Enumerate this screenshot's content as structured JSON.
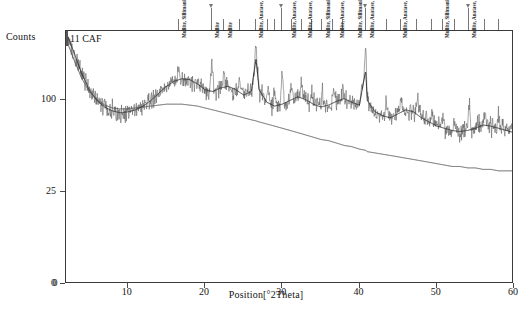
{
  "chart_data": {
    "type": "line",
    "title": "11 CAF",
    "xlabel": "Position[°2Theta]",
    "ylabel": "Counts",
    "xlim": [
      2,
      60
    ],
    "ylim_counts": [
      0,
      190
    ],
    "y_scale": "sqrt",
    "grid": false,
    "legend_position": "none",
    "xticks": [
      10,
      20,
      30,
      40,
      50,
      60
    ],
    "yticks": [
      0,
      25,
      100
    ],
    "series": [
      {
        "name": "measured-pattern",
        "color": "#555555",
        "description": "Noisy XRD intensity trace with broad amorphous humps and sharp crystalline peaks"
      },
      {
        "name": "background-fit",
        "color": "#333333",
        "description": "Smooth fitted background curve decaying from high angle-low counts"
      }
    ],
    "x": [
      2,
      3,
      4,
      5,
      6,
      7,
      8,
      9,
      10,
      11,
      12,
      13,
      14,
      15,
      16,
      17,
      18,
      19,
      20,
      21,
      22,
      23,
      24,
      25,
      26,
      26.6,
      27,
      28,
      29,
      30,
      31,
      32,
      33,
      34,
      35,
      36,
      37,
      38,
      39,
      40,
      40.8,
      41,
      42,
      43,
      44,
      45,
      46,
      47,
      48,
      49,
      50,
      51,
      52,
      53,
      54,
      55,
      56,
      57,
      58,
      59,
      60
    ],
    "y_counts": [
      188,
      160,
      132,
      112,
      100,
      93,
      89,
      87,
      88,
      90,
      94,
      100,
      108,
      116,
      122,
      125,
      124,
      119,
      112,
      110,
      114,
      116,
      112,
      106,
      110,
      150,
      112,
      98,
      94,
      96,
      100,
      104,
      101,
      96,
      93,
      95,
      99,
      102,
      98,
      95,
      135,
      100,
      88,
      84,
      82,
      86,
      90,
      88,
      82,
      78,
      74,
      72,
      70,
      69,
      70,
      72,
      75,
      74,
      72,
      70,
      68
    ],
    "background_counts": [
      178,
      150,
      126,
      110,
      101,
      95,
      92,
      91,
      91,
      92,
      93,
      94,
      95,
      96,
      96,
      96,
      95,
      94,
      92,
      90,
      88,
      86,
      84,
      82,
      80,
      79,
      78,
      76,
      74,
      72,
      70,
      68,
      66,
      64,
      62,
      61,
      59,
      57,
      56,
      54,
      53,
      52,
      51,
      50,
      49,
      48,
      47,
      46,
      45,
      44,
      43,
      42,
      41,
      41,
      40,
      40,
      39,
      39,
      38,
      38,
      38
    ],
    "peak_markers_2theta": [
      16.6,
      20.9,
      22.5,
      24.5,
      26.6,
      28.2,
      29.0,
      30.0,
      31.2,
      32.5,
      33.8,
      35.2,
      36.6,
      37.8,
      40.8,
      43.5,
      45.4,
      47.5,
      49.4,
      50.8,
      52.3,
      54.2,
      56.2,
      58.0
    ],
    "arrow_markers_2theta": [
      20.9,
      30.0,
      40.8,
      54.2
    ],
    "phase_annotations": [
      {
        "x2theta": 16.6,
        "label": "Mullite, Sillimanite"
      },
      {
        "x2theta": 20.9,
        "label": "Mullite"
      },
      {
        "x2theta": 22.5,
        "label": "Mullite"
      },
      {
        "x2theta": 26.6,
        "label": "Mullite, Anatase, syn, Sillimanite"
      },
      {
        "x2theta": 30.9,
        "label": "Mullite, Anatase, syn, Sillimanite"
      },
      {
        "x2theta": 32.9,
        "label": "Mullite, Anatase, syn, Sillimanite"
      },
      {
        "x2theta": 35.3,
        "label": "Mullite, Sillimanite"
      },
      {
        "x2theta": 37.1,
        "label": "Mullite, Anatase, syn, Sillimanite"
      },
      {
        "x2theta": 39.4,
        "label": "Mullite, Sillimanite"
      },
      {
        "x2theta": 40.9,
        "label": "Mullite, Anatase, syn, Sillimanite"
      },
      {
        "x2theta": 45.2,
        "label": "Mullite, Anatase, syn, Sillimanite"
      },
      {
        "x2theta": 50.6,
        "label": "Mullite, Sillimanite"
      },
      {
        "x2theta": 54.2,
        "label": "Mullite, Anatase, syn, Sillimanite"
      }
    ]
  },
  "axes": {
    "y_title": "Counts",
    "x_title": "Position[°2Theta]",
    "y_tick_labels": [
      "100",
      "25",
      "0"
    ],
    "x_tick_labels": [
      "10",
      "20",
      "30",
      "40",
      "50",
      "60"
    ]
  },
  "sample": {
    "id_label": "11 CAF"
  }
}
